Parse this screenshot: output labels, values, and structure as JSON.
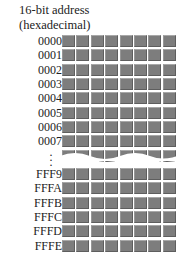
{
  "title_line1": "16-bit address",
  "title_line2": "(hexadecimal)",
  "columns": 8,
  "top_rows": [
    "0000",
    "0001",
    "0002",
    "0003",
    "0004",
    "0005",
    "0006",
    "0007"
  ],
  "bottom_rows": [
    "FFF9",
    "FFFA",
    "FFFB",
    "FFFC",
    "FFFD",
    "FFFE"
  ],
  "cell_color": "#7d7d7d",
  "ellipsis": "⋮"
}
